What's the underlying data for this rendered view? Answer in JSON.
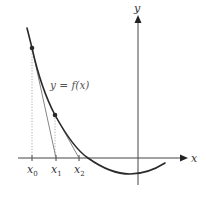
{
  "diagram": {
    "type": "newtons-method-illustration",
    "axes": {
      "x_label": "x",
      "y_label": "y"
    },
    "curve": {
      "label": "y = f(x)"
    },
    "iterates": [
      {
        "base": "x",
        "sub": "0"
      },
      {
        "base": "x",
        "sub": "1"
      },
      {
        "base": "x",
        "sub": "2"
      }
    ],
    "colors": {
      "curve": "#2a2a2a",
      "axes": "#444444",
      "tangent": "#777777",
      "dotted": "#999999",
      "points": "#2a2a2a"
    }
  }
}
